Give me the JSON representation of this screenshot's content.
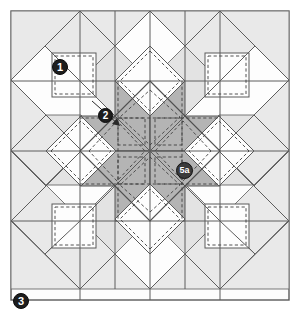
{
  "diagram": {
    "type": "quilt-block-piecing-diagram",
    "canvas": {
      "width": 301,
      "height": 318
    },
    "frame": {
      "x1": 11,
      "y1": 11,
      "x2": 289,
      "y2": 300
    },
    "center": {
      "x": 150,
      "y": 151
    },
    "colors": {
      "background": "#ffffff",
      "light_piece": "#e9e9e9",
      "mid_piece": "#dedede",
      "dark_piece": "#a9a9a9",
      "white_piece": "#fdfdfd",
      "seam_line": "#555555",
      "cut_line": "#3a3a3a",
      "dashed_line": "#4a4a4a",
      "label_dark": "#1d1d1d",
      "label_gray": "#3b3b3b",
      "label_text": "#ffffff"
    },
    "labels": [
      {
        "id": "label-1",
        "text": "1",
        "x": 60,
        "y": 67,
        "style": "dark",
        "leader": false
      },
      {
        "id": "label-2",
        "text": "2",
        "x": 105,
        "y": 115,
        "style": "dark",
        "leader": true
      },
      {
        "id": "label-5a",
        "text": "5a",
        "x": 184,
        "y": 170,
        "style": "gray",
        "leader": false
      },
      {
        "id": "label-3",
        "text": "3",
        "x": 21,
        "y": 301,
        "style": "dark",
        "leader": true
      }
    ],
    "legend_notes": {
      "solid_lines": "cutting / piece outlines",
      "dashed_lines": "stitching seam lines"
    },
    "piece_counts": {
      "star_points_dark": 8,
      "corner_squares_white": 4,
      "edge_diamonds_white": 4,
      "light_background_pieces": 16
    }
  }
}
